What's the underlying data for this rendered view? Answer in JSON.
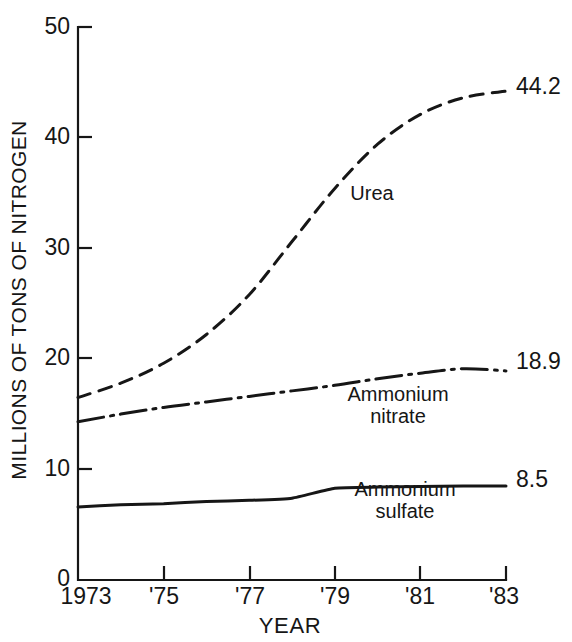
{
  "chart_data": {
    "type": "line",
    "title": "",
    "xlabel": "YEAR",
    "ylabel": "MILLIONS OF TONS OF NITROGEN",
    "xlim": [
      1973,
      1983
    ],
    "ylim": [
      0,
      50
    ],
    "grid": false,
    "legend_position": "inline-annotations",
    "x_tick_labels": [
      "1973",
      "'75",
      "'77",
      "'79",
      "'81",
      "'83"
    ],
    "x_tick_values": [
      1973,
      1975,
      1977,
      1979,
      1981,
      1983
    ],
    "y_tick_labels": [
      "0",
      "10",
      "20",
      "30",
      "40",
      "50"
    ],
    "y_tick_values": [
      0,
      10,
      20,
      30,
      40,
      50
    ],
    "x": [
      1973,
      1974,
      1975,
      1976,
      1977,
      1978,
      1979,
      1980,
      1981,
      1982,
      1983
    ],
    "series": [
      {
        "name": "Urea",
        "style": "dashed",
        "end_value": "44.2",
        "values": [
          16.5,
          17.8,
          19.6,
          22.2,
          25.8,
          30.6,
          35.4,
          39.4,
          42.1,
          43.6,
          44.2
        ]
      },
      {
        "name": "Ammonium nitrate",
        "style": "dash-dot",
        "end_value": "18.9",
        "values": [
          14.3,
          15.0,
          15.6,
          16.1,
          16.6,
          17.1,
          17.6,
          18.2,
          18.7,
          19.1,
          18.9
        ]
      },
      {
        "name": "Ammonium sulfate",
        "style": "solid",
        "end_value": "8.5",
        "values": [
          6.6,
          6.8,
          6.9,
          7.1,
          7.2,
          7.4,
          8.3,
          8.4,
          8.45,
          8.5,
          8.5
        ]
      }
    ],
    "annotations": [
      {
        "text": "Urea",
        "x": 1978.1,
        "y": 34.0
      },
      {
        "text": "Ammonium",
        "x": 1980.1,
        "y": 15.2
      },
      {
        "text": "nitrate",
        "x": 1980.1,
        "y": 13.2
      },
      {
        "text": "Ammonium",
        "x": 1980.4,
        "y": 6.6
      },
      {
        "text": "sulfate",
        "x": 1980.4,
        "y": 4.6
      }
    ],
    "colors": {
      "ink": "#161616",
      "background": "#ffffff"
    }
  }
}
